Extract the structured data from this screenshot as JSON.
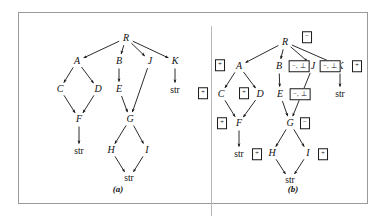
{
  "figure": {
    "panels": [
      {
        "id": "a",
        "caption": "(a)",
        "caption_pos": [
          99,
          176
        ],
        "nodes": [
          {
            "id": "R",
            "label": "R",
            "x": 107,
            "y": 25
          },
          {
            "id": "A",
            "label": "A",
            "x": 58,
            "y": 48
          },
          {
            "id": "B",
            "label": "B",
            "x": 100,
            "y": 48
          },
          {
            "id": "J",
            "label": "J",
            "x": 131,
            "y": 48
          },
          {
            "id": "K",
            "label": "K",
            "x": 156,
            "y": 48
          },
          {
            "id": "C",
            "label": "C",
            "x": 41,
            "y": 76
          },
          {
            "id": "D",
            "label": "D",
            "x": 79,
            "y": 76
          },
          {
            "id": "E",
            "label": "E",
            "x": 100,
            "y": 76
          },
          {
            "id": "F",
            "label": "F",
            "x": 60,
            "y": 106
          },
          {
            "id": "G",
            "label": "G",
            "x": 111,
            "y": 106
          },
          {
            "id": "H",
            "label": "H",
            "x": 92,
            "y": 137
          },
          {
            "id": "I",
            "label": "I",
            "x": 128,
            "y": 137
          }
        ],
        "leaves": [
          {
            "id": "K-str",
            "label": "str",
            "x": 156,
            "y": 78
          },
          {
            "id": "F-str",
            "label": "str",
            "x": 60,
            "y": 139
          },
          {
            "id": "HI-str",
            "label": "str",
            "x": 110,
            "y": 166
          }
        ],
        "edges": [
          {
            "from": "R",
            "to": "A"
          },
          {
            "from": "R",
            "to": "B"
          },
          {
            "from": "R",
            "to": "J"
          },
          {
            "from": "R",
            "to": "K"
          },
          {
            "from": "A",
            "to": "C"
          },
          {
            "from": "A",
            "to": "D"
          },
          {
            "from": "B",
            "to": "E"
          },
          {
            "from": "C",
            "to": "F"
          },
          {
            "from": "D",
            "to": "F"
          },
          {
            "from": "E",
            "to": "G"
          },
          {
            "from": "J",
            "to": "G"
          },
          {
            "from": "K",
            "to": "K-str"
          },
          {
            "from": "F",
            "to": "F-str"
          },
          {
            "from": "G",
            "to": "H"
          },
          {
            "from": "G",
            "to": "I"
          },
          {
            "from": "H",
            "to": "HI-str"
          },
          {
            "from": "I",
            "to": "HI-str"
          }
        ],
        "tags": []
      },
      {
        "id": "b",
        "caption": "(b)",
        "caption_pos": [
          99,
          176
        ],
        "nodes": [
          {
            "id": "R",
            "label": "R",
            "x": 91,
            "y": 29
          },
          {
            "id": "A",
            "label": "A",
            "x": 45,
            "y": 53
          },
          {
            "id": "B",
            "label": "B",
            "x": 85,
            "y": 53
          },
          {
            "id": "J",
            "label": "J",
            "x": 119,
            "y": 53
          },
          {
            "id": "K",
            "label": "K",
            "x": 146,
            "y": 53
          },
          {
            "id": "C",
            "label": "C",
            "x": 27,
            "y": 81
          },
          {
            "id": "D",
            "label": "D",
            "x": 66,
            "y": 81
          },
          {
            "id": "E",
            "label": "E",
            "x": 86,
            "y": 81
          },
          {
            "id": "F",
            "label": "F",
            "x": 45,
            "y": 110
          },
          {
            "id": "G",
            "label": "G",
            "x": 96,
            "y": 110
          },
          {
            "id": "H",
            "label": "H",
            "x": 78,
            "y": 140
          },
          {
            "id": "I",
            "label": "I",
            "x": 114,
            "y": 140
          }
        ],
        "leaves": [
          {
            "id": "K-str",
            "label": "str",
            "x": 146,
            "y": 82
          },
          {
            "id": "F-str",
            "label": "str",
            "x": 45,
            "y": 142
          },
          {
            "id": "HI-str",
            "label": "str",
            "x": 96,
            "y": 168
          }
        ],
        "edges": [
          {
            "from": "R",
            "to": "A"
          },
          {
            "from": "R",
            "to": "B"
          },
          {
            "from": "R",
            "to": "J"
          },
          {
            "from": "R",
            "to": "K"
          },
          {
            "from": "A",
            "to": "C"
          },
          {
            "from": "A",
            "to": "D"
          },
          {
            "from": "B",
            "to": "E"
          },
          {
            "from": "C",
            "to": "F"
          },
          {
            "from": "D",
            "to": "F"
          },
          {
            "from": "E",
            "to": "G"
          },
          {
            "from": "J",
            "to": "G"
          },
          {
            "from": "K",
            "to": "K-str"
          },
          {
            "from": "F",
            "to": "F-str"
          },
          {
            "from": "G",
            "to": "H"
          },
          {
            "from": "G",
            "to": "I"
          },
          {
            "from": "H",
            "to": "HI-str"
          },
          {
            "from": "I",
            "to": "HI-str"
          }
        ],
        "tags": [
          {
            "for": "R",
            "text": "−",
            "x": 113,
            "y": 24,
            "wide": false
          },
          {
            "for": "A",
            "text": "+",
            "x": 26,
            "y": 52,
            "wide": false
          },
          {
            "for": "B",
            "text": "−, ⊥",
            "x": 105,
            "y": 53,
            "wide": true
          },
          {
            "for": "J",
            "text": "−, ⊥",
            "x": 136,
            "y": 53,
            "wide": true
          },
          {
            "for": "K",
            "text": "+",
            "x": 163,
            "y": 53,
            "wide": false
          },
          {
            "for": "C",
            "text": "+",
            "x": 9,
            "y": 80,
            "wide": false
          },
          {
            "for": "D",
            "text": "+",
            "x": 50,
            "y": 80,
            "wide": false
          },
          {
            "for": "E",
            "text": "−, ⊥",
            "x": 106,
            "y": 81,
            "wide": true
          },
          {
            "for": "F",
            "text": "+",
            "x": 28,
            "y": 110,
            "wide": false
          },
          {
            "for": "G",
            "text": "−",
            "x": 111,
            "y": 110,
            "wide": false
          },
          {
            "for": "H",
            "text": "+",
            "x": 63,
            "y": 141,
            "wide": false
          },
          {
            "for": "I",
            "text": "+",
            "x": 129,
            "y": 141,
            "wide": false
          }
        ]
      }
    ]
  }
}
